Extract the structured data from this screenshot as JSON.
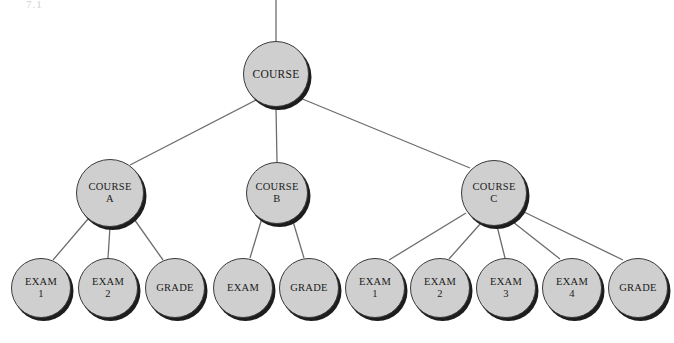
{
  "figure": {
    "type": "tree-diagram",
    "corner_mark": "7.1",
    "background_color": "#ffffff",
    "node_fill_color": "#cfcfcf",
    "node_border_color": "#3a3a3a",
    "node_shadow_color": "#1d1d1d",
    "edge_color": "#6d6d6d"
  },
  "nodes": {
    "root": {
      "id": "course",
      "line1": "COURSE",
      "line2": "",
      "cx": 276,
      "cy": 74,
      "r": 33
    },
    "level2": [
      {
        "id": "course-a",
        "line1": "COURSE",
        "line2": "A",
        "cx": 110,
        "cy": 193,
        "r": 34
      },
      {
        "id": "course-b",
        "line1": "COURSE",
        "line2": "B",
        "cx": 277,
        "cy": 193,
        "r": 31
      },
      {
        "id": "course-c",
        "line1": "COURSE",
        "line2": "C",
        "cx": 494,
        "cy": 193,
        "r": 33
      }
    ],
    "leaves": [
      {
        "id": "a-exam-1",
        "parent": "course-a",
        "line1": "EXAM",
        "line2": "1",
        "cx": 41,
        "cy": 288,
        "r": 30
      },
      {
        "id": "a-exam-2",
        "parent": "course-a",
        "line1": "EXAM",
        "line2": "2",
        "cx": 108,
        "cy": 288,
        "r": 30
      },
      {
        "id": "a-grade",
        "parent": "course-a",
        "line1": "GRADE",
        "line2": "",
        "cx": 175,
        "cy": 288,
        "r": 30
      },
      {
        "id": "b-exam",
        "parent": "course-b",
        "line1": "EXAM",
        "line2": "",
        "cx": 243,
        "cy": 288,
        "r": 30
      },
      {
        "id": "b-grade",
        "parent": "course-b",
        "line1": "GRADE",
        "line2": "",
        "cx": 309,
        "cy": 288,
        "r": 30
      },
      {
        "id": "c-exam-1",
        "parent": "course-c",
        "line1": "EXAM",
        "line2": "1",
        "cx": 375,
        "cy": 288,
        "r": 30
      },
      {
        "id": "c-exam-2",
        "parent": "course-c",
        "line1": "EXAM",
        "line2": "2",
        "cx": 440,
        "cy": 288,
        "r": 30
      },
      {
        "id": "c-exam-3",
        "parent": "course-c",
        "line1": "EXAM",
        "line2": "3",
        "cx": 506,
        "cy": 288,
        "r": 30
      },
      {
        "id": "c-exam-4",
        "parent": "course-c",
        "line1": "EXAM",
        "line2": "4",
        "cx": 572,
        "cy": 288,
        "r": 30
      },
      {
        "id": "c-grade",
        "parent": "course-c",
        "line1": "GRADE",
        "line2": "",
        "cx": 638,
        "cy": 288,
        "r": 30
      }
    ]
  },
  "edges": [
    {
      "from": "top-stub",
      "x1": 276,
      "y1": 0,
      "x2": 276,
      "y2": 41
    },
    {
      "from": "course",
      "to": "course-a",
      "x1": 256,
      "y1": 100,
      "x2": 130,
      "y2": 165
    },
    {
      "from": "course",
      "to": "course-b",
      "x1": 276,
      "y1": 107,
      "x2": 277,
      "y2": 162
    },
    {
      "from": "course",
      "to": "course-c",
      "x1": 300,
      "y1": 98,
      "x2": 470,
      "y2": 168
    },
    {
      "from": "course-a",
      "to": "a-exam-1",
      "x1": 88,
      "y1": 219,
      "x2": 53,
      "y2": 260
    },
    {
      "from": "course-a",
      "to": "a-exam-2",
      "x1": 110,
      "y1": 227,
      "x2": 108,
      "y2": 258
    },
    {
      "from": "course-a",
      "to": "a-grade",
      "x1": 134,
      "y1": 219,
      "x2": 163,
      "y2": 260
    },
    {
      "from": "course-b",
      "to": "b-exam",
      "x1": 262,
      "y1": 218,
      "x2": 250,
      "y2": 258
    },
    {
      "from": "course-b",
      "to": "b-grade",
      "x1": 292,
      "y1": 218,
      "x2": 304,
      "y2": 258
    },
    {
      "from": "course-c",
      "to": "c-exam-1",
      "x1": 466,
      "y1": 213,
      "x2": 389,
      "y2": 260
    },
    {
      "from": "course-c",
      "to": "c-exam-2",
      "x1": 481,
      "y1": 223,
      "x2": 449,
      "y2": 259
    },
    {
      "from": "course-c",
      "to": "c-exam-3",
      "x1": 497,
      "y1": 226,
      "x2": 505,
      "y2": 258
    },
    {
      "from": "course-c",
      "to": "c-exam-4",
      "x1": 513,
      "y1": 222,
      "x2": 560,
      "y2": 259
    },
    {
      "from": "course-c",
      "to": "c-grade",
      "x1": 524,
      "y1": 212,
      "x2": 623,
      "y2": 260
    }
  ]
}
